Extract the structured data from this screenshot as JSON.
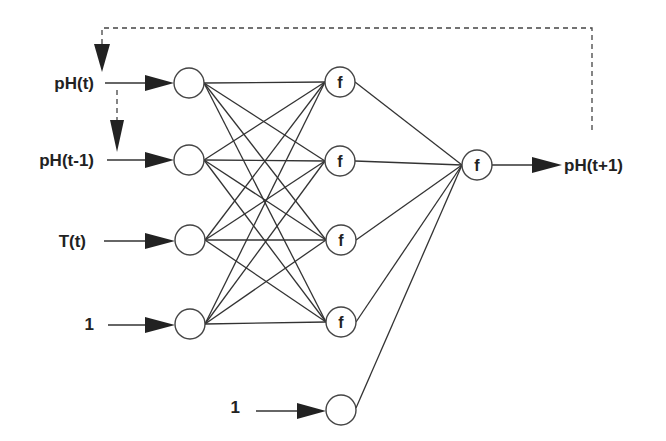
{
  "diagram": {
    "type": "recurrent-neural-network",
    "inputs": [
      {
        "label": "pH(t)",
        "x": 189,
        "y": 83
      },
      {
        "label": "pH(t-1)",
        "x": 189,
        "y": 160
      },
      {
        "label": "T(t)",
        "x": 190,
        "y": 240
      },
      {
        "label": "1",
        "x": 190,
        "y": 324
      }
    ],
    "hidden": [
      {
        "label": "f",
        "x": 340,
        "y": 82
      },
      {
        "label": "f",
        "x": 340,
        "y": 161
      },
      {
        "label": "f",
        "x": 341,
        "y": 240
      },
      {
        "label": "f",
        "x": 341,
        "y": 322
      }
    ],
    "hidden_bias": {
      "label": "1",
      "x": 341,
      "y": 408
    },
    "output": {
      "label": "f",
      "x": 477,
      "y": 165
    },
    "output_label": "pH(t+1)",
    "feedback": "pH(t+1) fed back to pH(t); pH(t) delayed to pH(t-1)",
    "colors": {
      "line": "#333333",
      "fill": "#ffffff"
    }
  }
}
